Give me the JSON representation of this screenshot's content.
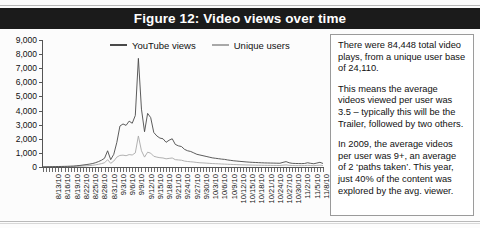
{
  "figure": {
    "title": "Figure 12: Video views over time"
  },
  "colors": {
    "title_bar_bg": "#1b1b1b",
    "title_text": "#ffffff",
    "series_youtube": "#4a4a4a",
    "series_unique": "#a8a8a8",
    "axis": "#555555",
    "note_border": "#9a9a9a",
    "page_bg": "#fcfcfc"
  },
  "legend": {
    "items": [
      {
        "label": "YouTube views",
        "color": "#4a4a4a"
      },
      {
        "label": "Unique users",
        "color": "#a8a8a8"
      }
    ]
  },
  "note": {
    "paragraphs": [
      "There were 84,448 total video plays, from a unique user base of 24,110.",
      "This means the average videos viewed per user was 3.5 – typically this will be the Trailer, followed by two others.",
      "In 2009, the average videos per user was 9+, an average of 2 ‘paths taken’. This year, just 40% of the content was explored by the avg. viewer."
    ]
  },
  "chart_data": {
    "type": "line",
    "title": "Figure 12: Video views over time",
    "xlabel": "",
    "ylabel": "",
    "ylim": [
      0,
      9000
    ],
    "ytick_labels": [
      "0",
      "1,000",
      "2,000",
      "3,000",
      "4,000",
      "5,000",
      "6,000",
      "7,000",
      "8,000",
      "9,000"
    ],
    "ytick_values": [
      0,
      1000,
      2000,
      3000,
      4000,
      5000,
      6000,
      7000,
      8000,
      9000
    ],
    "grid": false,
    "legend_position": "top-center",
    "xtick_labels": [
      "8/13/10",
      "8/16/10",
      "8/19/10",
      "8/22/10",
      "8/25/10",
      "8/28/10",
      "8/31/10",
      "9/3/10",
      "9/6/10",
      "9/9/10",
      "9/12/10",
      "9/15/10",
      "9/18/10",
      "9/21/10",
      "9/24/10",
      "9/27/10",
      "9/30/10",
      "10/3/10",
      "10/6/10",
      "10/9/10",
      "10/12/10",
      "10/15/10",
      "10/18/10",
      "10/21/10",
      "10/24/10",
      "10/27/10",
      "10/30/10",
      "11/2/10",
      "11/5/10",
      "11/8/10"
    ],
    "x_start": "8/10/10",
    "x_end": "11/9/10",
    "x_interval_days": 1,
    "xtick_label_every_days": 3,
    "series": [
      {
        "name": "YouTube views",
        "color": "#4a4a4a",
        "values": [
          10,
          15,
          20,
          25,
          30,
          35,
          40,
          45,
          50,
          60,
          70,
          90,
          110,
          140,
          170,
          200,
          240,
          300,
          380,
          480,
          620,
          1150,
          520,
          900,
          1750,
          2900,
          3050,
          2950,
          3250,
          3100,
          3650,
          7700,
          4100,
          2500,
          3800,
          3500,
          2450,
          2200,
          2050,
          2000,
          1750,
          1900,
          2000,
          1600,
          1500,
          1450,
          1250,
          1150,
          1100,
          1000,
          900,
          850,
          800,
          750,
          700,
          650,
          620,
          590,
          560,
          540,
          500,
          470,
          440,
          420,
          400,
          380,
          360,
          345,
          330,
          320,
          310,
          300,
          290,
          285,
          280,
          275,
          270,
          265,
          330,
          380,
          300,
          260,
          250,
          245,
          240,
          250,
          300,
          260,
          230,
          280,
          330,
          250
        ]
      },
      {
        "name": "Unique users",
        "color": "#a8a8a8",
        "values": [
          5,
          8,
          10,
          12,
          15,
          18,
          20,
          22,
          25,
          30,
          35,
          45,
          55,
          70,
          85,
          100,
          120,
          150,
          190,
          240,
          300,
          520,
          260,
          420,
          700,
          820,
          840,
          800,
          880,
          850,
          1000,
          2200,
          1150,
          700,
          1050,
          980,
          760,
          700,
          660,
          640,
          580,
          610,
          640,
          520,
          500,
          480,
          420,
          390,
          370,
          350,
          320,
          300,
          290,
          275,
          260,
          245,
          235,
          225,
          215,
          205,
          195,
          185,
          175,
          168,
          160,
          152,
          145,
          140,
          135,
          130,
          126,
          122,
          118,
          115,
          113,
          110,
          108,
          106,
          130,
          150,
          120,
          105,
          100,
          98,
          96,
          100,
          120,
          104,
          92,
          112,
          132,
          100
        ]
      }
    ]
  }
}
